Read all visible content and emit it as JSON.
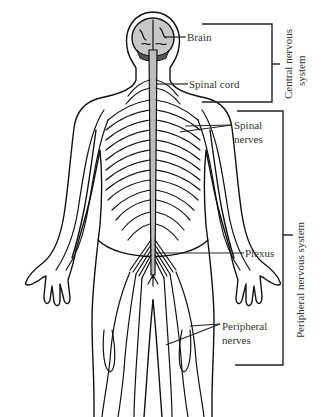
{
  "figure": {
    "labels": {
      "brain": "Brain",
      "spinal_cord": "Spinal cord",
      "spinal_nerves_1": "Spinal",
      "spinal_nerves_2": "nerves",
      "plexus": "Plexus",
      "peripheral_nerves_1": "Peripheral",
      "peripheral_nerves_2": "nerves"
    },
    "brackets": {
      "cns_1": "Central nervous",
      "cns_2": "system",
      "pns": "Peripheral nervous system"
    },
    "colors": {
      "line": "#111111",
      "brain_fill": "#c8c8c8",
      "cord_fill": "#bdbdbd",
      "label": "#333333"
    }
  }
}
